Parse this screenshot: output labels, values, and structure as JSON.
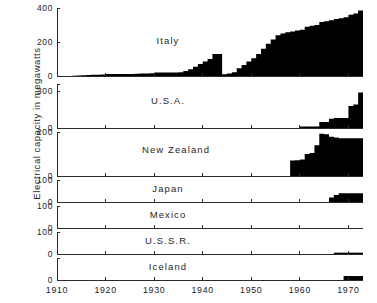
{
  "figure": {
    "ylabel": "Electrical capacity in megawatts"
  },
  "chart_data": {
    "type": "bar",
    "title": "",
    "subtitle": "",
    "xlabel": "",
    "ylabel": "Electrical capacity in megawatts",
    "grid": false,
    "legend": "none",
    "layout": "7 stacked panels sharing one x axis (year)",
    "xlim": [
      1910,
      1973
    ],
    "xticks": [
      1910,
      1920,
      1930,
      1940,
      1950,
      1960,
      1970
    ],
    "xticklabels": [
      "1910",
      "1920",
      "1930",
      "1940",
      "1950",
      "1960",
      "1970"
    ],
    "panels": [
      {
        "name": "Italy",
        "label": "Italy",
        "ylim": [
          0,
          400
        ],
        "yticks": [
          0,
          200,
          400
        ],
        "yticklabels": [
          "0",
          "200",
          "400"
        ],
        "x": [
          1913,
          1914,
          1915,
          1916,
          1917,
          1918,
          1919,
          1920,
          1921,
          1922,
          1923,
          1924,
          1925,
          1926,
          1927,
          1928,
          1929,
          1930,
          1931,
          1932,
          1933,
          1934,
          1935,
          1936,
          1937,
          1938,
          1939,
          1940,
          1941,
          1942,
          1943,
          1944,
          1945,
          1946,
          1947,
          1948,
          1949,
          1950,
          1951,
          1952,
          1953,
          1954,
          1955,
          1956,
          1957,
          1958,
          1959,
          1960,
          1961,
          1962,
          1963,
          1964,
          1965,
          1966,
          1967,
          1968,
          1969,
          1970,
          1971,
          1972,
          1973
        ],
        "values": [
          1,
          3,
          5,
          6,
          7,
          8,
          9,
          12,
          12,
          12,
          12,
          12,
          12,
          13,
          14,
          15,
          16,
          20,
          20,
          20,
          20,
          20,
          22,
          30,
          40,
          55,
          70,
          85,
          100,
          130,
          130,
          10,
          15,
          22,
          45,
          65,
          85,
          105,
          130,
          160,
          190,
          215,
          240,
          250,
          258,
          262,
          268,
          272,
          290,
          295,
          300,
          318,
          322,
          328,
          335,
          340,
          345,
          360,
          368,
          385,
          390
        ]
      },
      {
        "name": "U.S.A.",
        "label": "U.S.A.",
        "ylim": [
          0,
          360
        ],
        "yticks": [
          0,
          300
        ],
        "yticklabels": [
          "0",
          "300"
        ],
        "x": [
          1960,
          1961,
          1962,
          1963,
          1964,
          1965,
          1966,
          1967,
          1968,
          1969,
          1970,
          1971,
          1972,
          1973
        ],
        "values": [
          12,
          12,
          12,
          12,
          50,
          50,
          75,
          82,
          82,
          82,
          180,
          192,
          290,
          360
        ]
      },
      {
        "name": "New Zealand",
        "label": "New  Zealand",
        "ylim": [
          0,
          200
        ],
        "yticks": [
          0,
          200
        ],
        "yticklabels": [
          "0",
          "200"
        ],
        "x": [
          1958,
          1959,
          1960,
          1961,
          1962,
          1963,
          1964,
          1965,
          1966,
          1967,
          1968,
          1969,
          1970,
          1971,
          1972,
          1973
        ],
        "values": [
          70,
          72,
          75,
          100,
          105,
          140,
          192,
          190,
          178,
          175,
          172,
          172,
          172,
          172,
          172,
          172
        ]
      },
      {
        "name": "Japan",
        "label": "Japan",
        "ylim": [
          0,
          100
        ],
        "yticks": [
          0,
          100
        ],
        "yticklabels": [
          "0",
          "100"
        ],
        "x": [
          1966,
          1967,
          1968,
          1969,
          1970,
          1971,
          1972,
          1973
        ],
        "values": [
          20,
          32,
          40,
          40,
          40,
          40,
          40,
          40
        ]
      },
      {
        "name": "Mexico",
        "label": "Mexico",
        "ylim": [
          0,
          100
        ],
        "yticks": [
          0,
          100
        ],
        "yticklabels": [
          "0",
          "100"
        ],
        "x": [
          1973
        ],
        "values": [
          75
        ]
      },
      {
        "name": "U.S.S.R.",
        "label": "U.S.S.R.",
        "ylim": [
          0,
          100
        ],
        "yticks": [
          0,
          100
        ],
        "yticklabels": [
          "0",
          "100"
        ],
        "x": [
          1967,
          1968,
          1969,
          1970,
          1971,
          1972,
          1973
        ],
        "values": [
          6,
          6,
          6,
          6,
          6,
          6,
          6
        ]
      },
      {
        "name": "Iceland",
        "label": "Iceland",
        "ylim": [
          0,
          50
        ],
        "yticks": [
          0
        ],
        "yticklabels": [
          "0"
        ],
        "x": [
          1969,
          1970,
          1971,
          1972,
          1973
        ],
        "values": [
          9,
          9,
          9,
          9,
          9
        ]
      }
    ]
  }
}
